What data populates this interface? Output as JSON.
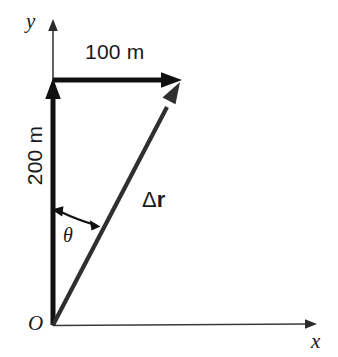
{
  "figure": {
    "type": "vector-displacement-diagram",
    "background_color": "#ffffff",
    "width": 338,
    "height": 357
  },
  "axes": {
    "x_label": "x",
    "y_label": "y",
    "origin_label": "O",
    "x_axis": {
      "from": [
        53,
        326
      ],
      "to": [
        316,
        324
      ]
    },
    "y_axis": {
      "from": [
        53,
        326
      ],
      "to": [
        53,
        22
      ]
    },
    "color": "#3a3a3a"
  },
  "vectors": {
    "y_component": {
      "name": "vertical-displacement",
      "label": "200 m",
      "magnitude": 200,
      "unit": "m",
      "direction": "up",
      "from": [
        53,
        325
      ],
      "to": [
        53,
        82
      ],
      "color": "#111111"
    },
    "x_component": {
      "name": "horizontal-displacement",
      "label": "100 m",
      "magnitude": 100,
      "unit": "m",
      "direction": "right",
      "from": [
        53,
        80
      ],
      "to": [
        181,
        80
      ],
      "color": "#111111"
    },
    "resultant": {
      "name": "displacement-resultant",
      "label_delta": "Δ",
      "label_symbol": "r",
      "from": [
        53,
        325
      ],
      "to": [
        179,
        84
      ],
      "color": "#2f2f2f"
    }
  },
  "angle": {
    "label": "θ",
    "description": "angle between vertical axis and resultant vector",
    "arc_start": [
      53,
      212
    ],
    "arc_end": [
      98,
      223
    ]
  }
}
